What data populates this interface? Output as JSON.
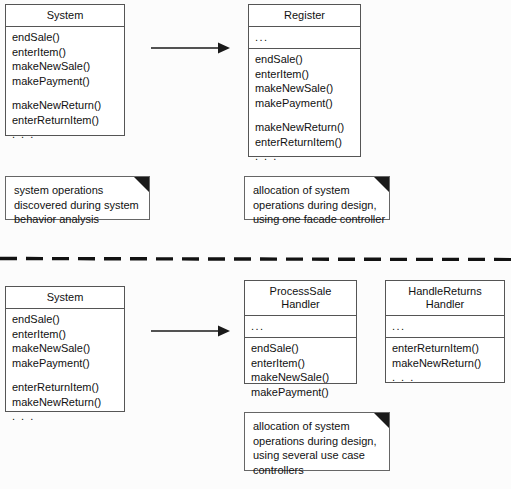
{
  "diagram": {
    "separator": {
      "name": "section-divider",
      "style": "dashed"
    },
    "colors": {
      "background": "#fcfcfc",
      "box_fill": "#ffffff",
      "box_border": "#555555",
      "text": "#111111",
      "note_fold": "#1a1a1a"
    }
  },
  "top_section": {
    "source_class": {
      "name": "System",
      "operations": [
        "endSale()",
        "enterItem()",
        "makeNewSale()",
        "makePayment()",
        "",
        "makeNewReturn()",
        "enterReturnItem()",
        ". . ."
      ]
    },
    "arrow": {
      "label": "",
      "direction": "right"
    },
    "target_class": {
      "name": "Register",
      "attributes": "...",
      "operations": [
        "endSale()",
        "enterItem()",
        "makeNewSale()",
        "makePayment()",
        "",
        "makeNewReturn()",
        "enterReturnItem()",
        ". . ."
      ]
    },
    "left_note": [
      "system operations",
      "discovered during system",
      "behavior analysis"
    ],
    "right_note": [
      "allocation of system",
      "operations during design,",
      "using one facade controller"
    ]
  },
  "bottom_section": {
    "source_class": {
      "name": "System",
      "operations": [
        "endSale()",
        "enterItem()",
        "makeNewSale()",
        "makePayment()",
        "",
        "enterReturnItem()",
        "makeNewReturn()",
        ". . ."
      ]
    },
    "arrow": {
      "label": "",
      "direction": "right"
    },
    "target_class_1": {
      "name_line_1": "ProcessSale",
      "name_line_2": "Handler",
      "attributes": "...",
      "operations": [
        "endSale()",
        "enterItem()",
        "makeNewSale()",
        "makePayment()"
      ]
    },
    "target_class_2": {
      "name_line_1": "HandleReturns",
      "name_line_2": "Handler",
      "attributes": "...",
      "operations": [
        "enterReturnItem()",
        "makeNewReturn()",
        ". . ."
      ]
    },
    "right_note": [
      "allocation of system",
      "operations during design,",
      "using several use case",
      "controllers"
    ]
  }
}
